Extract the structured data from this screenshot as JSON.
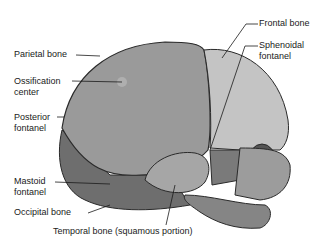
{
  "figure": {
    "labels": {
      "parietal_bone": "Parietal bone",
      "ossification_center_1": "Ossification",
      "ossification_center_2": "center",
      "posterior_fontanel_1": "Posterior",
      "posterior_fontanel_2": "fontanel",
      "mastoid_fontanel_1": "Mastoid",
      "mastoid_fontanel_2": "fontanel",
      "occipital_bone": "Occipital bone",
      "temporal_bone": "Temporal bone (squamous portion)",
      "frontal_bone": "Frontal bone",
      "sphenoidal_fontanel_1": "Sphenoidal",
      "sphenoidal_fontanel_2": "fontanel"
    },
    "colors": {
      "background": "#ffffff",
      "parietal": "#9a9a9a",
      "frontal": "#c4c4c4",
      "occipital": "#6e6e6e",
      "suture": "#2a2a2a",
      "text": "#1a1a1a"
    }
  }
}
